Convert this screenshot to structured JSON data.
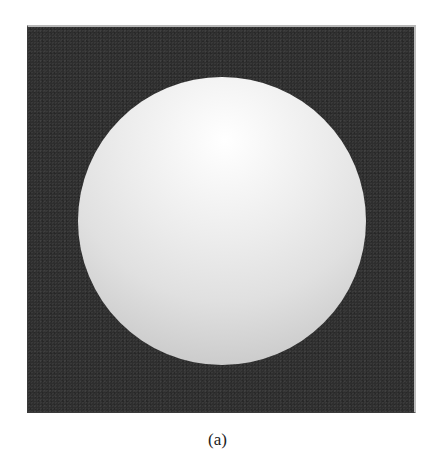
{
  "figure": {
    "caption": "(a)",
    "colors": {
      "background": "#2e2e2e",
      "sphere_highlight": "#ffffff",
      "sphere_edge": "#bdbdbd",
      "frame_border": "#b8b8b8"
    }
  }
}
